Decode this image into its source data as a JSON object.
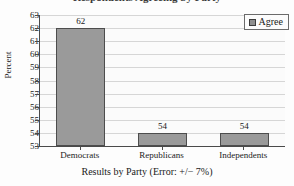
{
  "figure": {
    "clipped_title": "Respondents Agreeing by Party"
  },
  "legend": {
    "position": "top-right-inside",
    "entries": [
      {
        "label": "Agree",
        "color": "#8f8f8f"
      }
    ]
  },
  "axes": {
    "ylabel": "Percent",
    "xlabel": "Results by Party (Error: +/− 7%)",
    "yticks": [
      "63",
      "62",
      "61",
      "60",
      "59",
      "58",
      "57",
      "56",
      "55",
      "54",
      "53"
    ],
    "xticks": [
      "Democrats",
      "Republicans",
      "Independents"
    ]
  },
  "colors": {
    "bar_fill": "#9a9a9a",
    "bar_border": "#4d4d4d",
    "gridline": "#d6d6d6",
    "axis": "#4a4a4a",
    "plot_background": "#fbfbfb"
  },
  "chart_data": {
    "type": "bar",
    "title": "Respondents Agreeing by Party",
    "categories": [
      "Democrats",
      "Republicans",
      "Independents"
    ],
    "values": [
      62,
      54,
      54
    ],
    "data_labels": [
      "62",
      "54",
      "54"
    ],
    "series": [
      {
        "name": "Agree",
        "values": [
          62,
          54,
          54
        ],
        "color": "#9a9a9a"
      }
    ],
    "xlabel": "Results by Party (Error: +/− 7%)",
    "ylabel": "Percent",
    "ylim": [
      53,
      63
    ],
    "ytick_step": 1,
    "grid": true,
    "grid_axis": "y",
    "legend_position": "upper right",
    "error_note": "+/− 7%"
  }
}
